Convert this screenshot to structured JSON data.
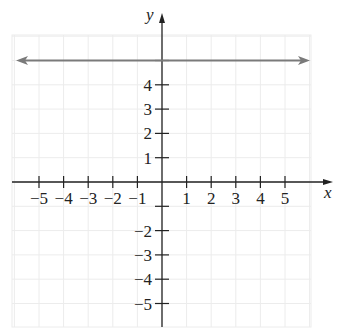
{
  "chart_data": {
    "type": "line",
    "title": "",
    "xlabel": "x",
    "ylabel": "y",
    "xlim": [
      -6,
      6
    ],
    "ylim": [
      -6,
      6
    ],
    "grid": true,
    "x_ticks": [
      -5,
      -4,
      -3,
      -2,
      -1,
      1,
      2,
      3,
      4,
      5
    ],
    "y_ticks": [
      -5,
      -4,
      -3,
      -2,
      1,
      2,
      3,
      4
    ],
    "x_tick_labels": [
      "−5",
      "−4",
      "−3",
      "−2",
      "−1",
      "1",
      "2",
      "3",
      "4",
      "5"
    ],
    "y_tick_labels": [
      "−5",
      "−4",
      "−3",
      "−2",
      "1",
      "2",
      "3",
      "4"
    ],
    "series": [
      {
        "name": "y = 5",
        "equation": "y = 5",
        "x": [
          -6,
          6
        ],
        "y": [
          5,
          5
        ],
        "arrows": "both",
        "color": "#7a7a7a"
      }
    ],
    "colors": {
      "grid": "#ececec",
      "axis": "#222222",
      "line": "#7a7a7a"
    }
  }
}
